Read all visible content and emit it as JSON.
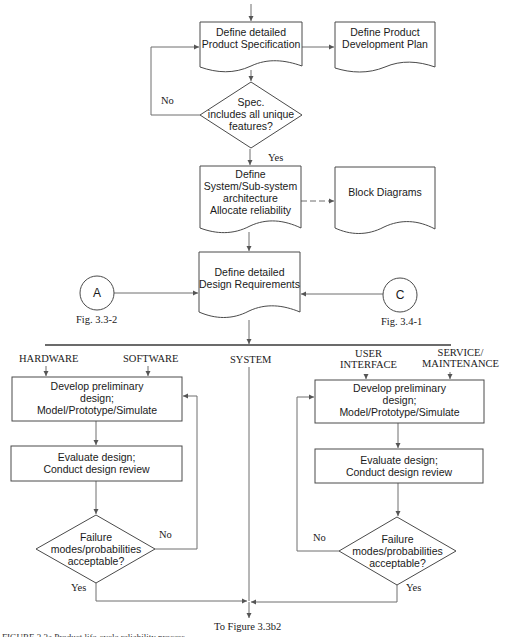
{
  "diagram": {
    "nodes": {
      "product_spec": {
        "lines": [
          "Define detailed",
          "Product Specification"
        ]
      },
      "dev_plan": {
        "lines": [
          "Define Product",
          "Development Plan"
        ]
      },
      "spec_decision": {
        "lines": [
          "Spec.",
          "includes all unique",
          "features?"
        ]
      },
      "architecture": {
        "lines": [
          "Define",
          "System/Sub-system",
          "architecture",
          "Allocate reliability"
        ]
      },
      "block_diagrams": {
        "lines": [
          "Block Diagrams"
        ]
      },
      "design_requirements": {
        "lines": [
          "Define detailed",
          "Design Requirements"
        ]
      },
      "left_develop": {
        "lines": [
          "Develop preliminary",
          "design;",
          "Model/Prototype/Simulate"
        ]
      },
      "left_evaluate": {
        "lines": [
          "Evaluate design;",
          "Conduct design review"
        ]
      },
      "left_decision": {
        "lines": [
          "Failure",
          "modes/probabilities",
          "acceptable?"
        ]
      },
      "right_develop": {
        "lines": [
          "Develop preliminary",
          "design;",
          "Model/Prototype/Simulate"
        ]
      },
      "right_evaluate": {
        "lines": [
          "Evaluate design;",
          "Conduct design review"
        ]
      },
      "right_decision": {
        "lines": [
          "Failure",
          "modes/probabilities",
          "acceptable?"
        ]
      }
    },
    "connectors": {
      "a": {
        "letter": "A",
        "ref": "Fig. 3.3-2"
      },
      "c": {
        "letter": "C",
        "ref": "Fig. 3.4-1"
      }
    },
    "edge_labels": {
      "spec_no": "No",
      "spec_yes": "Yes",
      "left_no": "No",
      "left_yes": "Yes",
      "right_no": "No",
      "right_yes": "Yes"
    },
    "branches": {
      "hardware": [
        "HARDWARE"
      ],
      "software": [
        "SOFTWARE"
      ],
      "system": [
        "SYSTEM"
      ],
      "user_interface": [
        "USER",
        "INTERFACE"
      ],
      "service": [
        "SERVICE/",
        "MAINTENANCE"
      ]
    },
    "output_label": "To Figure 3.3b2",
    "caption": "FIGURE 3.3a    Product life-cycle reliability process"
  },
  "colors": {
    "line": "#6f6f6f",
    "box_border": "#4a4a4a",
    "text": "#1a1a1a",
    "background": "#ffffff"
  }
}
